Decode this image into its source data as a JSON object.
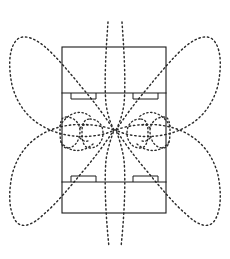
{
  "figure": {
    "title": "Antenna radiation pattern over slotted rectangular ground plane",
    "background_color": "#ffffff",
    "line_color": "#1a1a1a",
    "pattern_color": "#2b2b2b",
    "canvas": {
      "width": 230,
      "height": 259
    }
  },
  "ground_plane": {
    "label": "rectangular board outline",
    "x": 62,
    "y": 47,
    "width": 104,
    "height": 166
  },
  "divider_lines": [
    {
      "name": "upper-divider",
      "y": 93,
      "x1": 62,
      "x2": 166
    },
    {
      "name": "lower-divider",
      "y": 182,
      "x1": 62,
      "x2": 166
    }
  ],
  "slots": [
    {
      "name": "slot-top-left",
      "x": 71,
      "y": 93,
      "width": 25,
      "height": 6,
      "side": "below"
    },
    {
      "name": "slot-top-right",
      "x": 133,
      "y": 93,
      "width": 25,
      "height": 6,
      "side": "below"
    },
    {
      "name": "slot-bottom-left",
      "x": 71,
      "y": 176,
      "width": 25,
      "height": 6,
      "side": "above"
    },
    {
      "name": "slot-bottom-right",
      "x": 133,
      "y": 176,
      "width": 25,
      "height": 6,
      "side": "above"
    }
  ],
  "pattern_lobes": {
    "style": "dotted",
    "count_major": 4,
    "count_minor": 4,
    "description": "Four large dotted petal lobes in the diagonal quadrants plus four small dotted lobes near the centre of the board",
    "bounds": {
      "left": 10,
      "top": 22,
      "right": 220,
      "bottom": 247
    },
    "major": [
      {
        "name": "lobe-upper-left",
        "quadrant": "upper-left"
      },
      {
        "name": "lobe-upper-right",
        "quadrant": "upper-right"
      },
      {
        "name": "lobe-lower-left",
        "quadrant": "lower-left"
      },
      {
        "name": "lobe-lower-right",
        "quadrant": "lower-right"
      }
    ],
    "minor": [
      {
        "name": "minor-lobe-left-outer",
        "position": "left-outer"
      },
      {
        "name": "minor-lobe-left-inner",
        "position": "left-inner"
      },
      {
        "name": "minor-lobe-right-inner",
        "position": "right-inner"
      },
      {
        "name": "minor-lobe-right-outer",
        "position": "right-outer"
      }
    ]
  },
  "chart_data": {
    "type": "line",
    "title": "Antenna radiation pattern over slotted rectangular ground plane",
    "subtitle": "",
    "xlabel": "",
    "ylabel": "",
    "grid": false,
    "legend": "none",
    "center": {
      "x": 114,
      "y": 130
    },
    "series": [
      {
        "name": "major-lobe-upper-left",
        "style": "dotted",
        "closed": true,
        "points": [
          [
            114,
            130
          ],
          [
            100,
            110
          ],
          [
            82,
            88
          ],
          [
            62,
            66
          ],
          [
            44,
            47
          ],
          [
            28,
            36
          ],
          [
            16,
            42
          ],
          [
            11,
            60
          ],
          [
            12,
            82
          ],
          [
            20,
            103
          ],
          [
            34,
            120
          ],
          [
            54,
            132
          ],
          [
            76,
            137
          ],
          [
            96,
            136
          ],
          [
            108,
            134
          ]
        ]
      },
      {
        "name": "major-lobe-upper-right",
        "style": "dotted",
        "closed": true,
        "points": [
          [
            116,
            130
          ],
          [
            130,
            110
          ],
          [
            148,
            88
          ],
          [
            168,
            66
          ],
          [
            186,
            47
          ],
          [
            202,
            36
          ],
          [
            214,
            42
          ],
          [
            219,
            60
          ],
          [
            218,
            82
          ],
          [
            210,
            103
          ],
          [
            196,
            120
          ],
          [
            176,
            132
          ],
          [
            154,
            137
          ],
          [
            134,
            136
          ],
          [
            122,
            134
          ]
        ]
      },
      {
        "name": "major-lobe-lower-left",
        "style": "dotted",
        "closed": true,
        "points": [
          [
            114,
            130
          ],
          [
            100,
            150
          ],
          [
            82,
            172
          ],
          [
            62,
            194
          ],
          [
            44,
            213
          ],
          [
            28,
            228
          ],
          [
            16,
            234
          ],
          [
            11,
            218
          ],
          [
            12,
            192
          ],
          [
            20,
            170
          ],
          [
            34,
            152
          ],
          [
            54,
            140
          ],
          [
            76,
            137
          ],
          [
            96,
            137
          ],
          [
            108,
            136
          ]
        ]
      },
      {
        "name": "major-lobe-lower-right",
        "style": "dotted",
        "closed": true,
        "points": [
          [
            116,
            130
          ],
          [
            130,
            150
          ],
          [
            148,
            172
          ],
          [
            168,
            194
          ],
          [
            186,
            213
          ],
          [
            202,
            228
          ],
          [
            214,
            234
          ],
          [
            219,
            218
          ],
          [
            218,
            192
          ],
          [
            210,
            170
          ],
          [
            196,
            152
          ],
          [
            176,
            140
          ],
          [
            154,
            137
          ],
          [
            134,
            137
          ],
          [
            122,
            136
          ]
        ]
      },
      {
        "name": "minor-lobe-left-outer",
        "style": "dotted",
        "closed": true,
        "points": [
          [
            66,
            118
          ],
          [
            74,
            120
          ],
          [
            79,
            127
          ],
          [
            79,
            137
          ],
          [
            74,
            145
          ],
          [
            66,
            147
          ],
          [
            62,
            140
          ],
          [
            61,
            128
          ]
        ]
      },
      {
        "name": "minor-lobe-left-inner",
        "style": "dotted",
        "closed": true,
        "points": [
          [
            88,
            120
          ],
          [
            97,
            122
          ],
          [
            102,
            129
          ],
          [
            102,
            139
          ],
          [
            96,
            146
          ],
          [
            88,
            147
          ],
          [
            83,
            139
          ],
          [
            83,
            128
          ]
        ]
      },
      {
        "name": "minor-lobe-right-inner",
        "style": "dotted",
        "closed": true,
        "points": [
          [
            142,
            120
          ],
          [
            133,
            122
          ],
          [
            128,
            129
          ],
          [
            128,
            139
          ],
          [
            134,
            146
          ],
          [
            142,
            147
          ],
          [
            147,
            139
          ],
          [
            147,
            128
          ]
        ]
      },
      {
        "name": "minor-lobe-right-outer",
        "style": "dotted",
        "closed": true,
        "points": [
          [
            164,
            118
          ],
          [
            156,
            120
          ],
          [
            151,
            127
          ],
          [
            151,
            137
          ],
          [
            156,
            145
          ],
          [
            164,
            147
          ],
          [
            168,
            140
          ],
          [
            169,
            128
          ]
        ]
      }
    ]
  }
}
